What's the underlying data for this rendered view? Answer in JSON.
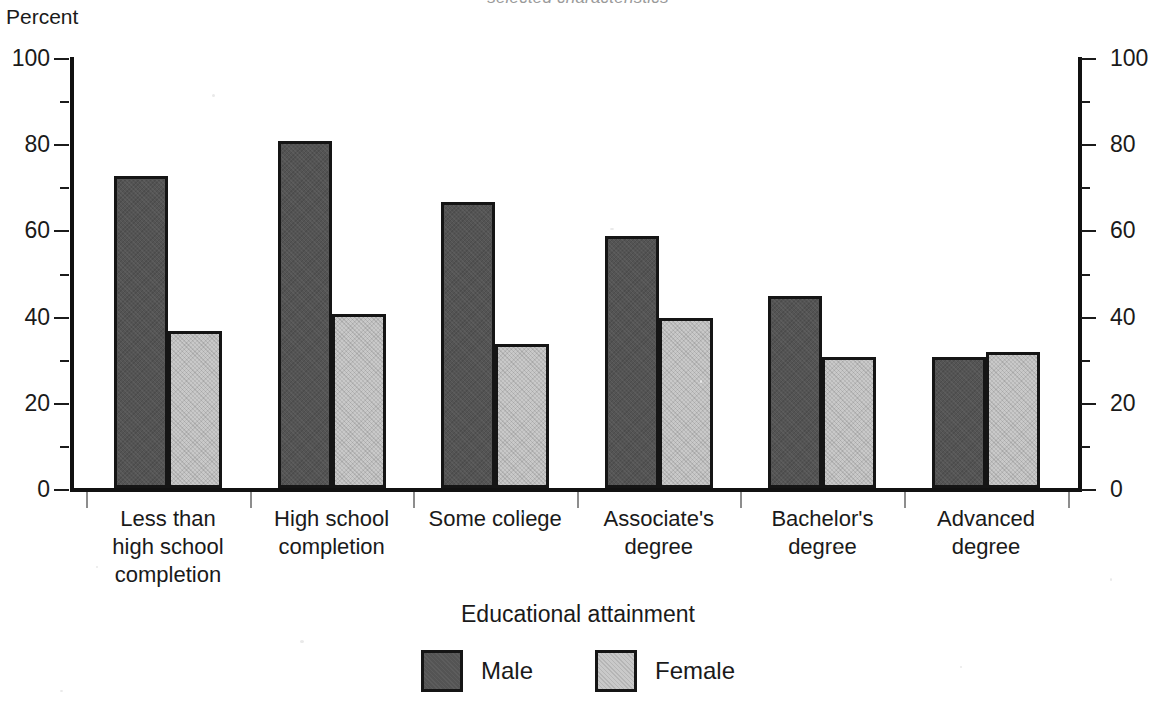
{
  "figure": {
    "title_remnant": "selected characteristics",
    "y_axis_caption": "Percent",
    "x_axis_title": "Educational attainment"
  },
  "legend": {
    "position": "bottom-center",
    "items": [
      {
        "label": "Male",
        "key": "male",
        "color": "#545454"
      },
      {
        "label": "Female",
        "key": "female",
        "color": "#c9c9c9"
      }
    ]
  },
  "axis": {
    "y_ticks_major": [
      "0",
      "20",
      "40",
      "60",
      "80",
      "100"
    ],
    "y_tick_values": [
      0,
      20,
      40,
      60,
      80,
      100
    ],
    "y_minor_values": [
      10,
      30,
      50,
      70,
      90
    ],
    "y_min": 0,
    "y_max": 100,
    "right_axis_mirrored": true
  },
  "chart_data": {
    "type": "bar",
    "title": "",
    "xlabel": "Educational attainment",
    "ylabel": "Percent",
    "ylim": [
      0,
      100
    ],
    "grid": false,
    "legend_position": "bottom-center",
    "categories": [
      "Less than high school completion",
      "High school completion",
      "Some college",
      "Associate's degree",
      "Bachelor's degree",
      "Advanced degree"
    ],
    "category_label_lines": [
      [
        "Less than",
        "high school",
        "completion"
      ],
      [
        "High school",
        "completion"
      ],
      [
        "Some college"
      ],
      [
        "Associate's",
        "degree"
      ],
      [
        "Bachelor's",
        "degree"
      ],
      [
        "Advanced",
        "degree"
      ]
    ],
    "series": [
      {
        "name": "Male",
        "key": "male",
        "color": "#545454",
        "values": [
          72,
          80,
          66,
          58,
          44,
          30
        ]
      },
      {
        "name": "Female",
        "key": "female",
        "color": "#c9c9c9",
        "values": [
          36,
          40,
          33,
          39,
          30,
          31
        ]
      }
    ]
  }
}
